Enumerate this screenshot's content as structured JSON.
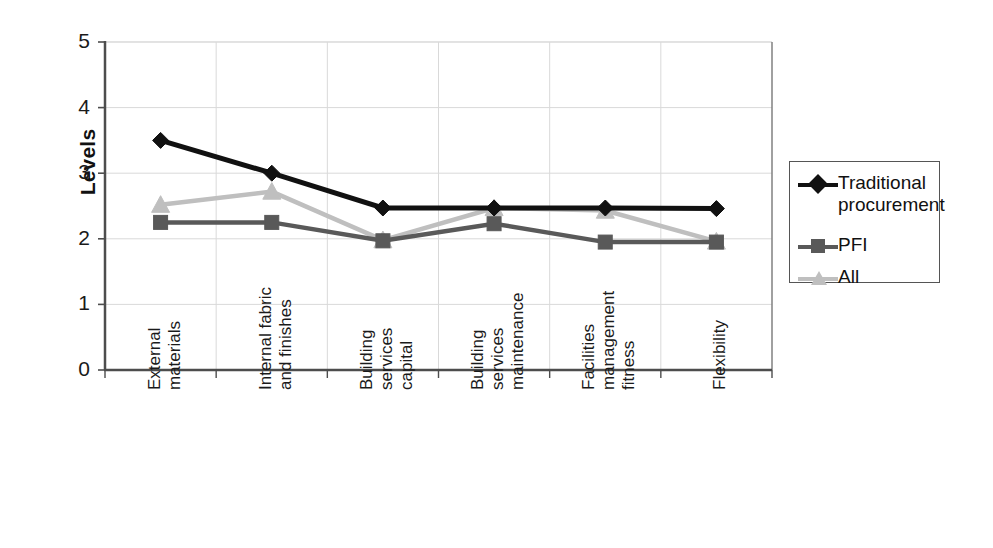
{
  "chart_data": {
    "type": "line",
    "title": "",
    "xlabel": "",
    "ylabel": "Levels",
    "ylim": [
      0,
      5
    ],
    "yticks": [
      0,
      1,
      2,
      3,
      4,
      5
    ],
    "grid": true,
    "grid_axes": "both",
    "legend_position": "right",
    "categories": [
      "External materials",
      "Internal fabric and finishes",
      "Building services capital",
      "Building services maintenance",
      "Facilities management fitness",
      "Flexibility"
    ],
    "category_lines": [
      [
        "External",
        "materials"
      ],
      [
        "Internal fabric",
        "and finishes"
      ],
      [
        "Building",
        "services",
        "capital"
      ],
      [
        "Building",
        "services",
        "maintenance"
      ],
      [
        "Facilities",
        "management",
        "fitness"
      ],
      [
        "Flexibility"
      ]
    ],
    "series": [
      {
        "name": "Traditional procurement",
        "legend_lines": [
          "Traditional",
          "procurement"
        ],
        "marker": "diamond",
        "color": "#111111",
        "values": [
          3.5,
          3.0,
          2.47,
          2.47,
          2.47,
          2.46
        ]
      },
      {
        "name": "PFI",
        "legend_lines": [
          "PFI"
        ],
        "marker": "square",
        "color": "#595959",
        "values": [
          2.25,
          2.25,
          1.97,
          2.23,
          1.95,
          1.95
        ]
      },
      {
        "name": "All",
        "legend_lines": [
          "All"
        ],
        "marker": "triangle",
        "color": "#bfbfbf",
        "values": [
          2.52,
          2.72,
          1.98,
          2.47,
          2.43,
          1.96
        ]
      }
    ]
  },
  "axis": {
    "y_title": "Levels",
    "y_tick_labels": [
      "5",
      "4",
      "3",
      "2",
      "1",
      "0"
    ]
  },
  "legend": {
    "items": [
      {
        "label": "Traditional\nprocurement"
      },
      {
        "label": "PFI"
      },
      {
        "label": "All"
      }
    ]
  },
  "colors": {
    "series_traditional": "#111111",
    "series_pfi": "#595959",
    "series_all": "#bfbfbf",
    "axis": "#4d4d4d",
    "grid": "#d9d9d9",
    "background": "#ffffff"
  }
}
